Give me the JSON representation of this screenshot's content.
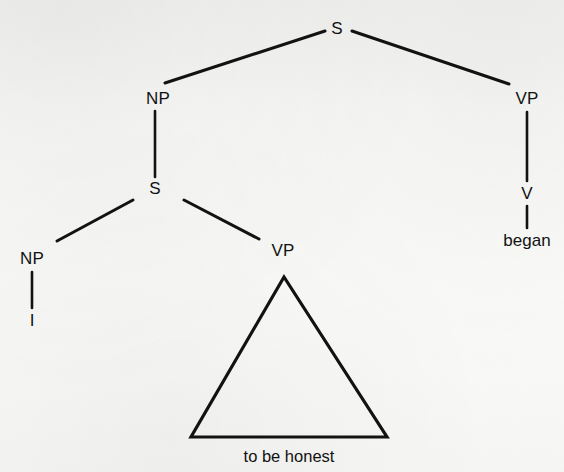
{
  "figure": {
    "kind": "syntax-tree",
    "sentence": "I to be honest began",
    "ink_color": "#121212",
    "paper_color": "#f7f7f5",
    "width": 564,
    "height": 472
  },
  "nodes": [
    {
      "id": "s-root",
      "label": "S",
      "x": 337,
      "y": 28,
      "type": "nonterminal"
    },
    {
      "id": "np-subject",
      "label": "NP",
      "x": 158,
      "y": 98,
      "type": "nonterminal"
    },
    {
      "id": "vp-main",
      "label": "VP",
      "x": 527,
      "y": 98,
      "type": "nonterminal"
    },
    {
      "id": "s-embedded",
      "label": "S",
      "x": 155,
      "y": 188,
      "type": "nonterminal"
    },
    {
      "id": "v-main",
      "label": "V",
      "x": 527,
      "y": 193,
      "type": "nonterminal"
    },
    {
      "id": "np-embedded",
      "label": "NP",
      "x": 32,
      "y": 258,
      "type": "nonterminal"
    },
    {
      "id": "vp-embedded",
      "label": "VP",
      "x": 283,
      "y": 250,
      "type": "nonterminal"
    }
  ],
  "terminals": [
    {
      "id": "terminal-i",
      "label": "I",
      "x": 32,
      "y": 320
    },
    {
      "id": "terminal-began",
      "label": "began",
      "x": 527,
      "y": 240
    }
  ],
  "triangle": {
    "id": "vp-triangle",
    "apex_x": 284,
    "apex_y": 277,
    "base_left_x": 191,
    "base_right_x": 387,
    "base_y": 437,
    "caption": "to be honest",
    "caption_x": 289,
    "caption_y": 456
  },
  "edges": [
    {
      "id": "edge-s-np",
      "from": "s-root",
      "to": "np-subject",
      "x1": 325,
      "y1": 31,
      "x2": 165,
      "y2": 83,
      "style": "diagonal"
    },
    {
      "id": "edge-s-vp",
      "from": "s-root",
      "to": "vp-main",
      "x1": 352,
      "y1": 31,
      "x2": 509,
      "y2": 84,
      "style": "diagonal"
    },
    {
      "id": "edge-np-s",
      "from": "np-subject",
      "to": "s-embedded",
      "x1": 155,
      "y1": 111,
      "x2": 155,
      "y2": 177,
      "style": "vertical"
    },
    {
      "id": "edge-vp-v",
      "from": "vp-main",
      "to": "v-main",
      "x1": 527,
      "y1": 112,
      "x2": 527,
      "y2": 181,
      "style": "vertical"
    },
    {
      "id": "edge-s2-np2",
      "from": "s-embedded",
      "to": "np-embedded",
      "x1": 133,
      "y1": 200,
      "x2": 57,
      "y2": 241,
      "style": "diagonal"
    },
    {
      "id": "edge-s2-vp2",
      "from": "s-embedded",
      "to": "vp-embedded",
      "x1": 184,
      "y1": 200,
      "x2": 259,
      "y2": 239,
      "style": "diagonal"
    },
    {
      "id": "edge-np2-i",
      "from": "np-embedded",
      "to": "terminal-i",
      "x1": 32,
      "y1": 272,
      "x2": 32,
      "y2": 308,
      "style": "vertical"
    },
    {
      "id": "edge-v-began",
      "from": "v-main",
      "to": "terminal-began",
      "x1": 527,
      "y1": 206,
      "x2": 527,
      "y2": 228,
      "style": "vertical"
    }
  ]
}
